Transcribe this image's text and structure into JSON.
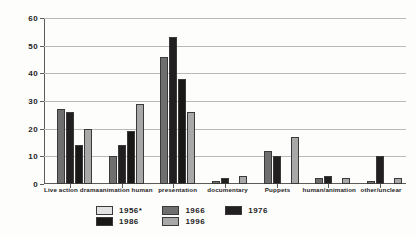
{
  "chart_data": {
    "type": "bar",
    "title": "",
    "xlabel": "",
    "ylabel": "",
    "ylim": [
      0,
      60
    ],
    "yticks": [
      0,
      10,
      20,
      30,
      40,
      50,
      60
    ],
    "grid": true,
    "legend_position": "bottom",
    "categories": [
      "Live action drama",
      "animation human",
      "presentation",
      "documentary",
      "Puppets",
      "human/animation",
      "other/unclear"
    ],
    "series": [
      {
        "name": "1956*",
        "color": "#e2e2e2",
        "values": [
          0,
          0,
          0,
          0,
          0,
          0,
          0
        ]
      },
      {
        "name": "1966",
        "color": "#6f6f6f",
        "values": [
          27,
          10,
          46,
          1,
          12,
          2,
          1
        ]
      },
      {
        "name": "1976",
        "color": "#211f1f",
        "values": [
          26,
          14,
          53,
          2,
          10,
          3,
          10
        ]
      },
      {
        "name": "1986",
        "color": "#1a1717",
        "values": [
          14,
          19,
          38,
          0,
          0,
          0,
          0
        ]
      },
      {
        "name": "1996",
        "color": "#a8a8a8",
        "values": [
          20,
          29,
          26,
          3,
          17,
          2,
          2
        ]
      }
    ]
  },
  "legend": {
    "entries": [
      {
        "label": "1956*",
        "swatch": "#e2e2e2"
      },
      {
        "label": "1966",
        "swatch": "#6f6f6f"
      },
      {
        "label": "1976",
        "swatch": "#211f1f"
      },
      {
        "label": "1986",
        "swatch": "#1a1717"
      },
      {
        "label": "1996",
        "swatch": "#a8a8a8"
      }
    ]
  },
  "axis": {
    "y_tick_labels": [
      "0",
      "10",
      "20",
      "30",
      "40",
      "50",
      "60"
    ]
  }
}
